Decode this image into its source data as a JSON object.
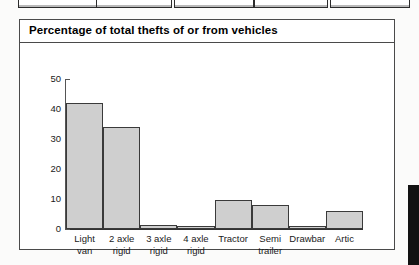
{
  "panel": {
    "title": "Percentage of total thefts of or from vehicles"
  },
  "top_boxes": [
    {
      "name": "top-box-1"
    },
    {
      "name": "top-box-2"
    },
    {
      "name": "top-box-3"
    },
    {
      "name": "top-box-4"
    },
    {
      "name": "top-box-5"
    }
  ],
  "colors": {
    "bar_fill": "#cfcfcf",
    "bar_border": "#3a3a3a",
    "axis": "#555555",
    "panel_border": "#4a4a4a",
    "text": "#1a1a1a",
    "page_edge": "#121212"
  },
  "chart_data": {
    "type": "bar",
    "title": "Percentage of total thefts of or from vehicles",
    "xlabel": "",
    "ylabel": "",
    "ylim": [
      0,
      50
    ],
    "yticks": [
      0,
      10,
      20,
      30,
      40,
      50
    ],
    "grid": false,
    "legend": false,
    "categories": [
      "Light van",
      "2 axle rigid",
      "3 axle rigid",
      "4 axle rigid",
      "Tractor",
      "Semi trailer",
      "Drawbar",
      "Artic"
    ],
    "category_lines": [
      [
        "Light",
        "van"
      ],
      [
        "2 axle",
        "rigid"
      ],
      [
        "3 axle",
        "rigid"
      ],
      [
        "4 axle",
        "rigid"
      ],
      [
        "Tractor",
        ""
      ],
      [
        "Semi",
        "trailer"
      ],
      [
        "Drawbar",
        ""
      ],
      [
        "Artic",
        ""
      ]
    ],
    "values": [
      42,
      34,
      1.5,
      1,
      9.7,
      8,
      1,
      6
    ]
  }
}
